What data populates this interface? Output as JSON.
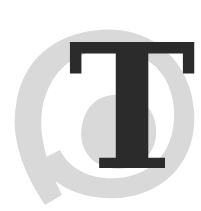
{
  "dropcap": {
    "letter": "T",
    "letter_color": "#2b2b2b",
    "swirl_color": "#d9d9d9",
    "background": "#ffffff"
  }
}
